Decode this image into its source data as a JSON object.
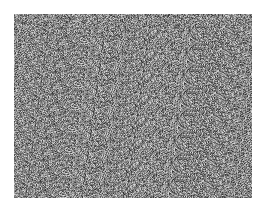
{
  "image": {
    "description": "grayscale random noise texture",
    "background_color": "#ffffff",
    "noise_region": {
      "x": 14,
      "y": 14,
      "width": 238,
      "height": 184
    },
    "noise_gray_range": [
      40,
      230
    ]
  }
}
